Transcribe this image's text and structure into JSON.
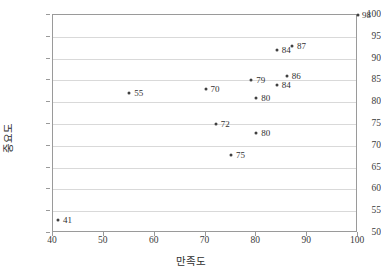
{
  "chart_data": {
    "type": "scatter",
    "title": "",
    "xlabel": "만족도",
    "ylabel": "중요도",
    "xlim": [
      40,
      100
    ],
    "ylim": [
      50,
      100
    ],
    "xticks": [
      40,
      50,
      60,
      70,
      80,
      90,
      100
    ],
    "yticks": [
      50,
      55,
      60,
      65,
      70,
      75,
      80,
      85,
      90,
      95,
      100
    ],
    "grid": "horizontal",
    "legend": "none",
    "marker_color": "#404040",
    "gridline_color": "#d9d9d9",
    "axis_color": "#9a9a9a",
    "points": [
      {
        "label": "41",
        "x": 41,
        "y": 53,
        "lx": 5,
        "ly": -4
      },
      {
        "label": "55",
        "x": 55,
        "y": 82,
        "lx": 5,
        "ly": -4
      },
      {
        "label": "70",
        "x": 70,
        "y": 83,
        "lx": 5,
        "ly": -4
      },
      {
        "label": "72",
        "x": 72,
        "y": 75,
        "lx": 5,
        "ly": -4
      },
      {
        "label": "75",
        "x": 75,
        "y": 68,
        "lx": 5,
        "ly": -4
      },
      {
        "label": "79",
        "x": 79,
        "y": 85,
        "lx": 5,
        "ly": -4
      },
      {
        "label": "80",
        "x": 80,
        "y": 81,
        "lx": 5,
        "ly": -4
      },
      {
        "label": "80",
        "x": 80,
        "y": 73,
        "lx": 5,
        "ly": -4
      },
      {
        "label": "84",
        "x": 84,
        "y": 84,
        "lx": 5,
        "ly": -4
      },
      {
        "label": "84",
        "x": 84,
        "y": 92,
        "lx": 5,
        "ly": -4
      },
      {
        "label": "86",
        "x": 86,
        "y": 86,
        "lx": 5,
        "ly": -4
      },
      {
        "label": "87",
        "x": 87,
        "y": 93,
        "lx": 5,
        "ly": -4
      },
      {
        "label": "98",
        "x": 100,
        "y": 100,
        "lx": 4,
        "ly": -4
      }
    ]
  }
}
